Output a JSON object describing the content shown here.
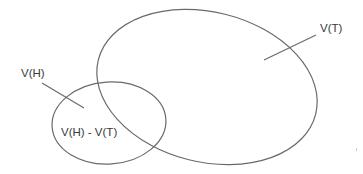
{
  "diagram": {
    "type": "venn",
    "sets": [
      {
        "id": "vt",
        "label": "V(T)"
      },
      {
        "id": "vh",
        "label": "V(H)"
      }
    ],
    "region_label": "V(H) - V(T)",
    "colors": {
      "stroke": "#6a6a6a",
      "text": "#3a3a3a",
      "background": "#ffffff"
    }
  }
}
